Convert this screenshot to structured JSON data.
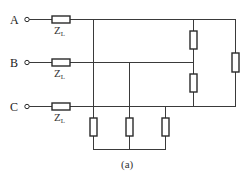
{
  "figure": {
    "caption": "(a)",
    "type": "three-phase circuit"
  },
  "terminals": [
    {
      "label": "A",
      "line_impedance": "Z",
      "line_impedance_sub": "L"
    },
    {
      "label": "B",
      "line_impedance": "Z",
      "line_impedance_sub": "L"
    },
    {
      "label": "C",
      "line_impedance": "Z",
      "line_impedance_sub": "L"
    }
  ],
  "loads": {
    "delta": [
      "A-B",
      "B-C",
      "A-C"
    ],
    "star": [
      "A",
      "B",
      "C"
    ]
  },
  "colors": {
    "wire": "#3a3a3a",
    "background": "#ffffff"
  }
}
